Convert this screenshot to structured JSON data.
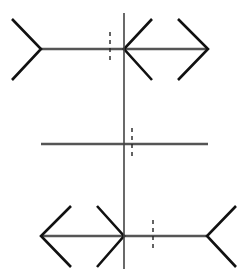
{
  "figure": {
    "width": 248,
    "height": 276,
    "colors": {
      "background": "#ffffff",
      "shaft": "#555555",
      "fin": "#111111",
      "axis": "#444444",
      "dash": "#222222"
    },
    "vertical_axis": {
      "x": 124,
      "y1": 13,
      "y2": 269
    },
    "rows": [
      {
        "name": "top",
        "shaft": {
          "x1": 41,
          "x2": 208,
          "y": 49
        },
        "fins": [
          {
            "points": "12,19 41,49 12,80"
          },
          {
            "points": "152,19 124,49 152,80"
          },
          {
            "points": "178,19 208,49 178,80"
          }
        ],
        "dash": {
          "x": 110,
          "y1": 32,
          "y2": 63
        }
      },
      {
        "name": "middle",
        "shaft": {
          "x1": 41,
          "x2": 208,
          "y": 144
        },
        "fins": [],
        "dash": {
          "x": 132,
          "y1": 128,
          "y2": 159
        }
      },
      {
        "name": "bottom",
        "shaft": {
          "x1": 41,
          "x2": 207,
          "y": 236
        },
        "fins": [
          {
            "points": "71,206 41,236 71,267"
          },
          {
            "points": "97,206 124,236 97,267"
          },
          {
            "points": "236,206 207,236 236,267"
          }
        ],
        "dash": {
          "x": 153,
          "y1": 220,
          "y2": 251
        }
      }
    ]
  }
}
